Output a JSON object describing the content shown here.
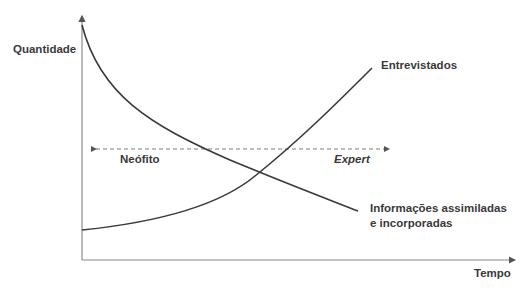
{
  "axes": {
    "y_label": "Quantidade",
    "x_label": "Tempo"
  },
  "curves": {
    "increasing": {
      "label": "Entrevistados"
    },
    "decreasing": {
      "label_line1": "Informações assimiladas",
      "label_line2": "e incorporadas"
    }
  },
  "range_arrow": {
    "left_label": "Neófito",
    "right_label": "Expert"
  },
  "colors": {
    "line": "#3a3a3a",
    "axis": "#8a8a8a",
    "dashed": "#7a7a7a",
    "text": "#3a3a3a"
  }
}
